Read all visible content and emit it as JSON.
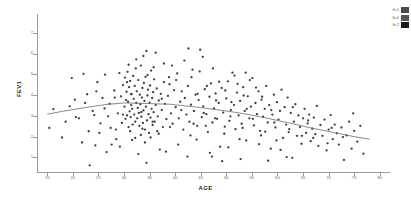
{
  "chart_data": {
    "type": "scatter",
    "title": "",
    "xlabel": "AGE",
    "ylabel": "FEV1",
    "xlim": [
      13,
      82
    ],
    "ylim": [
      0.3,
      7.9
    ],
    "grid": false,
    "legend_position": "top-right",
    "xticks": [
      15,
      20,
      25,
      30,
      35,
      40,
      45,
      50,
      55,
      60,
      65,
      70,
      75,
      80
    ],
    "yticks": [
      1,
      2,
      3,
      4,
      5,
      6,
      7
    ],
    "legend": [
      {
        "label": "fit.1",
        "color": "#4a4a4a"
      },
      {
        "label": "fit.0",
        "color": "#555555"
      },
      {
        "label": "fit.2",
        "color": "#1a1a1a"
      }
    ],
    "marker": {
      "color": "#3c3c44",
      "size": 1.15,
      "shape": "dot"
    },
    "fit_line": {
      "name": "loess-fit",
      "color": "#6b6b73",
      "width": 0.8,
      "points": [
        [
          15,
          3.08
        ],
        [
          18,
          3.22
        ],
        [
          21,
          3.34
        ],
        [
          24,
          3.46
        ],
        [
          27,
          3.56
        ],
        [
          30,
          3.62
        ],
        [
          33,
          3.61
        ],
        [
          36,
          3.58
        ],
        [
          39,
          3.56
        ],
        [
          42,
          3.48
        ],
        [
          45,
          3.4
        ],
        [
          48,
          3.3
        ],
        [
          51,
          3.2
        ],
        [
          54,
          3.08
        ],
        [
          57,
          2.94
        ],
        [
          60,
          2.78
        ],
        [
          63,
          2.62
        ],
        [
          66,
          2.45
        ],
        [
          69,
          2.3
        ],
        [
          72,
          2.15
        ],
        [
          75,
          2.0
        ],
        [
          78,
          1.88
        ]
      ]
    },
    "points": [
      [
        15.4,
        2.42
      ],
      [
        16.2,
        3.32
      ],
      [
        17.9,
        1.96
      ],
      [
        18.6,
        2.72
      ],
      [
        19.8,
        4.82
      ],
      [
        20.4,
        3.78
      ],
      [
        21.2,
        2.88
      ],
      [
        22.1,
        5.02
      ],
      [
        22.8,
        4.04
      ],
      [
        23.3,
        0.62
      ],
      [
        23.9,
        3.24
      ],
      [
        24.4,
        1.58
      ],
      [
        24.8,
        4.62
      ],
      [
        25.2,
        2.18
      ],
      [
        25.8,
        3.86
      ],
      [
        26.3,
        4.98
      ],
      [
        26.9,
        2.98
      ],
      [
        27.2,
        3.58
      ],
      [
        27.6,
        1.62
      ],
      [
        28.1,
        4.22
      ],
      [
        28.4,
        2.34
      ],
      [
        28.8,
        3.12
      ],
      [
        29.1,
        5.06
      ],
      [
        29.4,
        3.94
      ],
      [
        29.6,
        2.66
      ],
      [
        29.8,
        4.48
      ],
      [
        30.1,
        3.44
      ],
      [
        30.2,
        4.84
      ],
      [
        30.3,
        2.86
      ],
      [
        30.4,
        3.76
      ],
      [
        30.5,
        4.16
      ],
      [
        30.6,
        3.02
      ],
      [
        30.7,
        5.12
      ],
      [
        30.8,
        3.68
      ],
      [
        30.9,
        2.46
      ],
      [
        31.0,
        4.38
      ],
      [
        31.1,
        3.22
      ],
      [
        31.2,
        4.68
      ],
      [
        31.3,
        2.94
      ],
      [
        31.4,
        3.52
      ],
      [
        31.5,
        4.06
      ],
      [
        31.6,
        3.34
      ],
      [
        31.7,
        2.58
      ],
      [
        31.8,
        4.92
      ],
      [
        31.9,
        3.82
      ],
      [
        32.0,
        3.06
      ],
      [
        32.1,
        4.44
      ],
      [
        32.2,
        2.72
      ],
      [
        32.3,
        5.28
      ],
      [
        32.4,
        3.62
      ],
      [
        32.5,
        4.18
      ],
      [
        32.6,
        2.88
      ],
      [
        32.7,
        3.38
      ],
      [
        32.8,
        4.72
      ],
      [
        32.9,
        3.14
      ],
      [
        33.0,
        2.52
      ],
      [
        33.1,
        4.02
      ],
      [
        33.2,
        3.56
      ],
      [
        33.3,
        5.42
      ],
      [
        33.4,
        2.96
      ],
      [
        33.5,
        3.88
      ],
      [
        33.6,
        4.34
      ],
      [
        33.7,
        2.66
      ],
      [
        33.8,
        3.26
      ],
      [
        33.9,
        4.58
      ],
      [
        34.0,
        3.72
      ],
      [
        34.1,
        2.34
      ],
      [
        34.2,
        4.88
      ],
      [
        34.3,
        3.44
      ],
      [
        34.4,
        6.12
      ],
      [
        34.5,
        2.78
      ],
      [
        34.6,
        3.98
      ],
      [
        34.7,
        4.26
      ],
      [
        34.8,
        3.08
      ],
      [
        34.9,
        2.18
      ],
      [
        35.0,
        3.64
      ],
      [
        35.1,
        4.46
      ],
      [
        35.2,
        2.92
      ],
      [
        35.3,
        5.18
      ],
      [
        35.4,
        3.34
      ],
      [
        35.5,
        3.86
      ],
      [
        35.6,
        2.56
      ],
      [
        35.7,
        4.14
      ],
      [
        35.8,
        3.18
      ],
      [
        35.9,
        4.76
      ],
      [
        36.0,
        2.72
      ],
      [
        36.2,
        3.52
      ],
      [
        36.4,
        4.32
      ],
      [
        36.6,
        2.98
      ],
      [
        36.8,
        3.74
      ],
      [
        37.0,
        1.38
      ],
      [
        37.2,
        4.06
      ],
      [
        37.4,
        3.28
      ],
      [
        37.6,
        2.46
      ],
      [
        37.8,
        4.62
      ],
      [
        38.0,
        3.58
      ],
      [
        38.3,
        2.84
      ],
      [
        38.6,
        3.96
      ],
      [
        38.9,
        4.52
      ],
      [
        39.2,
        3.12
      ],
      [
        39.5,
        2.62
      ],
      [
        39.8,
        4.24
      ],
      [
        40.1,
        3.42
      ],
      [
        40.4,
        5.04
      ],
      [
        40.7,
        2.88
      ],
      [
        41.0,
        3.68
      ],
      [
        41.3,
        4.18
      ],
      [
        41.6,
        2.34
      ],
      [
        41.9,
        3.86
      ],
      [
        42.2,
        3.06
      ],
      [
        42.5,
        4.44
      ],
      [
        42.8,
        2.72
      ],
      [
        43.1,
        3.54
      ],
      [
        43.4,
        5.22
      ],
      [
        43.7,
        3.24
      ],
      [
        44.0,
        4.02
      ],
      [
        44.3,
        2.52
      ],
      [
        44.6,
        3.76
      ],
      [
        44.9,
        6.18
      ],
      [
        45.2,
        2.94
      ],
      [
        45.5,
        3.46
      ],
      [
        45.8,
        4.28
      ],
      [
        46.1,
        3.08
      ],
      [
        46.4,
        2.22
      ],
      [
        46.7,
        3.92
      ],
      [
        47.0,
        4.56
      ],
      [
        47.3,
        2.68
      ],
      [
        47.6,
        3.36
      ],
      [
        47.9,
        4.08
      ],
      [
        48.2,
        2.86
      ],
      [
        48.5,
        3.62
      ],
      [
        48.8,
        1.52
      ],
      [
        49.1,
        4.34
      ],
      [
        49.4,
        3.16
      ],
      [
        49.7,
        2.48
      ],
      [
        50.0,
        3.84
      ],
      [
        50.3,
        4.66
      ],
      [
        50.6,
        2.76
      ],
      [
        50.9,
        3.28
      ],
      [
        51.2,
        5.08
      ],
      [
        51.5,
        3.52
      ],
      [
        51.8,
        2.36
      ],
      [
        52.1,
        4.12
      ],
      [
        52.4,
        3.02
      ],
      [
        52.7,
        3.72
      ],
      [
        53.0,
        2.62
      ],
      [
        53.3,
        4.38
      ],
      [
        53.6,
        3.24
      ],
      [
        53.9,
        1.82
      ],
      [
        54.2,
        3.94
      ],
      [
        54.5,
        2.88
      ],
      [
        54.8,
        3.44
      ],
      [
        55.1,
        4.82
      ],
      [
        55.4,
        2.54
      ],
      [
        55.7,
        3.62
      ],
      [
        56.0,
        3.08
      ],
      [
        56.3,
        4.18
      ],
      [
        56.6,
        2.28
      ],
      [
        56.9,
        3.78
      ],
      [
        57.2,
        2.96
      ],
      [
        57.5,
        3.34
      ],
      [
        57.8,
        4.44
      ],
      [
        58.1,
        2.68
      ],
      [
        58.4,
        3.52
      ],
      [
        58.7,
        1.42
      ],
      [
        59.0,
        3.06
      ],
      [
        59.3,
        4.02
      ],
      [
        59.6,
        2.44
      ],
      [
        59.9,
        3.66
      ],
      [
        60.2,
        2.82
      ],
      [
        60.5,
        3.24
      ],
      [
        60.8,
        4.26
      ],
      [
        61.1,
        1.94
      ],
      [
        61.4,
        3.42
      ],
      [
        61.7,
        2.58
      ],
      [
        62.0,
        3.88
      ],
      [
        62.3,
        2.36
      ],
      [
        62.6,
        3.14
      ],
      [
        62.9,
        0.98
      ],
      [
        63.2,
        2.72
      ],
      [
        63.5,
        3.56
      ],
      [
        63.8,
        2.04
      ],
      [
        64.1,
        3.02
      ],
      [
        64.4,
        2.46
      ],
      [
        64.7,
        1.66
      ],
      [
        65.0,
        2.88
      ],
      [
        65.3,
        3.34
      ],
      [
        65.6,
        2.18
      ],
      [
        65.9,
        2.64
      ],
      [
        66.2,
        3.06
      ],
      [
        66.5,
        1.78
      ],
      [
        66.8,
        2.38
      ],
      [
        67.1,
        2.92
      ],
      [
        67.4,
        2.12
      ],
      [
        67.7,
        3.48
      ],
      [
        68.0,
        1.56
      ],
      [
        68.4,
        2.56
      ],
      [
        68.8,
        2.04
      ],
      [
        69.2,
        2.82
      ],
      [
        69.6,
        1.34
      ],
      [
        70.0,
        2.34
      ],
      [
        70.4,
        3.04
      ],
      [
        70.8,
        1.88
      ],
      [
        71.2,
        2.58
      ],
      [
        71.6,
        2.16
      ],
      [
        72.0,
        1.62
      ],
      [
        72.5,
        2.44
      ],
      [
        73.0,
        0.88
      ],
      [
        73.5,
        2.06
      ],
      [
        74.0,
        2.72
      ],
      [
        74.5,
        1.42
      ],
      [
        75.0,
        2.28
      ],
      [
        75.6,
        1.76
      ],
      [
        76.2,
        2.52
      ],
      [
        76.8,
        1.18
      ],
      [
        33.3,
        2.08
      ],
      [
        34.1,
        1.72
      ],
      [
        35.2,
        1.96
      ],
      [
        36.5,
        2.26
      ],
      [
        31.6,
        1.84
      ],
      [
        30.9,
        5.46
      ],
      [
        32.4,
        5.72
      ],
      [
        33.8,
        5.88
      ],
      [
        34.6,
        4.96
      ],
      [
        35.8,
        5.34
      ],
      [
        39.4,
        5.42
      ],
      [
        40.2,
        4.72
      ],
      [
        41.8,
        5.66
      ],
      [
        42.6,
        6.24
      ],
      [
        43.2,
        4.86
      ],
      [
        44.8,
        5.14
      ],
      [
        46.2,
        4.44
      ],
      [
        47.4,
        5.28
      ],
      [
        48.6,
        4.64
      ],
      [
        49.8,
        4.22
      ],
      [
        52.2,
        4.54
      ],
      [
        53.4,
        3.98
      ],
      [
        54.6,
        4.72
      ],
      [
        55.8,
        4.36
      ],
      [
        57.0,
        3.92
      ],
      [
        29.2,
        1.52
      ],
      [
        28.5,
        1.88
      ],
      [
        27.4,
        2.42
      ],
      [
        26.6,
        1.26
      ],
      [
        25.4,
        2.64
      ],
      [
        24.2,
        3.04
      ],
      [
        23.1,
        2.26
      ],
      [
        21.8,
        1.72
      ],
      [
        20.6,
        2.94
      ],
      [
        19.4,
        3.46
      ],
      [
        38.2,
        1.28
      ],
      [
        40.6,
        1.62
      ],
      [
        42.4,
        1.04
      ],
      [
        44.2,
        1.86
      ],
      [
        46.8,
        1.22
      ],
      [
        50.4,
        1.48
      ],
      [
        52.8,
        0.92
      ],
      [
        56.4,
        1.64
      ],
      [
        58.2,
        0.84
      ],
      [
        60.6,
        1.36
      ],
      [
        36.2,
        6.04
      ],
      [
        37.8,
        5.52
      ],
      [
        45.4,
        5.84
      ],
      [
        51.6,
        4.94
      ],
      [
        53.8,
        5.08
      ],
      [
        32.8,
        1.16
      ],
      [
        34.4,
        0.74
      ],
      [
        47.2,
        1.04
      ],
      [
        49.2,
        0.82
      ],
      [
        61.8,
        1.02
      ],
      [
        30.6,
        4.62
      ],
      [
        31.4,
        4.04
      ],
      [
        33.4,
        3.18
      ],
      [
        35.6,
        2.72
      ],
      [
        37.4,
        3.82
      ],
      [
        39.0,
        2.46
      ],
      [
        41.2,
        3.28
      ],
      [
        43.6,
        2.62
      ],
      [
        45.6,
        3.14
      ],
      [
        47.8,
        2.88
      ],
      [
        50.8,
        2.98
      ],
      [
        53.2,
        2.42
      ],
      [
        55.2,
        2.86
      ],
      [
        57.6,
        2.24
      ],
      [
        59.4,
        2.68
      ],
      [
        62.2,
        2.22
      ],
      [
        64.8,
        2.04
      ],
      [
        67.0,
        1.94
      ],
      [
        69.8,
        1.68
      ],
      [
        72.8,
        1.98
      ],
      [
        22.4,
        3.62
      ],
      [
        24.6,
        4.18
      ],
      [
        26.2,
        3.36
      ],
      [
        28.2,
        3.88
      ],
      [
        29.8,
        3.06
      ],
      [
        38.8,
        4.86
      ],
      [
        44.4,
        4.06
      ],
      [
        48.0,
        3.74
      ],
      [
        51.0,
        3.66
      ],
      [
        54.0,
        3.34
      ],
      [
        58.8,
        3.28
      ],
      [
        63.0,
        3.42
      ],
      [
        66.0,
        2.78
      ],
      [
        70.6,
        2.42
      ],
      [
        74.8,
        3.12
      ],
      [
        31.2,
        2.26
      ],
      [
        32.2,
        1.94
      ],
      [
        33.6,
        2.38
      ],
      [
        36.8,
        2.14
      ],
      [
        43.0,
        2.06
      ],
      [
        46.0,
        2.52
      ],
      [
        49.6,
        2.14
      ],
      [
        52.6,
        1.88
      ],
      [
        56.8,
        2.06
      ],
      [
        59.8,
        1.82
      ]
    ]
  }
}
